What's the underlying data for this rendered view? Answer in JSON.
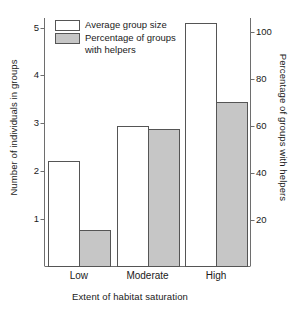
{
  "chart_data": {
    "type": "bar",
    "title": "",
    "xlabel": "Extent of habitat saturation",
    "categories": [
      "Low",
      "Moderate",
      "High"
    ],
    "series": [
      {
        "name": "Average group size",
        "axis": "left",
        "values": [
          2.2,
          2.93,
          5.1
        ],
        "fill": "#ffffff",
        "stroke": "#555555"
      },
      {
        "name": "Percentage of groups with helpers",
        "axis": "right",
        "values": [
          15.5,
          58.5,
          70.0
        ],
        "fill": "#c6c6c6",
        "stroke": "#555555"
      }
    ],
    "axes": {
      "left": {
        "label": "Number of individuals in groups",
        "ticks": [
          1,
          2,
          3,
          4,
          5
        ],
        "tick_labels": [
          "1",
          "2",
          "3",
          "4",
          "5"
        ],
        "lim": [
          0,
          5.2
        ]
      },
      "right": {
        "label": "Percentage of groups with helpers",
        "ticks": [
          20,
          40,
          60,
          80,
          100
        ],
        "tick_labels": [
          "20",
          "40",
          "60",
          "80",
          "100"
        ],
        "lim": [
          0,
          106
        ]
      }
    },
    "grid": false,
    "legend": {
      "position": "top-left",
      "entries": [
        {
          "label": "Average group size",
          "swatch": "open"
        },
        {
          "label": "Percentage of groups\nwith helpers",
          "swatch": "filled"
        }
      ]
    }
  },
  "colors": {
    "bar_open_fill": "#ffffff",
    "bar_filled_fill": "#c6c6c6",
    "bar_stroke": "#555555",
    "axis": "#6e6e6e",
    "text": "#1a1a1a",
    "background": "#ffffff"
  }
}
